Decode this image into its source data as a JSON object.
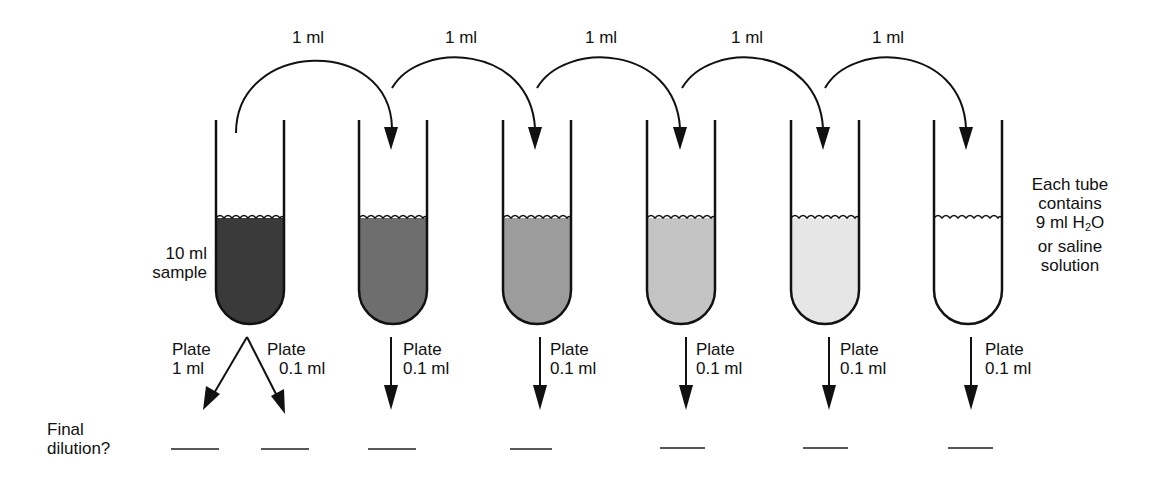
{
  "transfer_labels": [
    "1 ml",
    "1 ml",
    "1 ml",
    "1 ml",
    "1 ml"
  ],
  "sample_label": [
    "10 ml",
    "sample"
  ],
  "tube_note": [
    "Each tube",
    "contains",
    "9 ml H",
    "2",
    "O",
    "or saline",
    "solution"
  ],
  "tubes": [
    {
      "fill": "#3a3a3a"
    },
    {
      "fill": "#6e6e6e"
    },
    {
      "fill": "#9c9c9c"
    },
    {
      "fill": "#c4c4c4"
    },
    {
      "fill": "#e6e6e6"
    },
    {
      "fill": "#ffffff"
    }
  ],
  "plate_labels": [
    {
      "line1": "Plate",
      "line2": "1 ml"
    },
    {
      "line1": "Plate",
      "line2": "0.1 ml"
    },
    {
      "line1": "Plate",
      "line2": "0.1 ml"
    },
    {
      "line1": "Plate",
      "line2": "0.1 ml"
    },
    {
      "line1": "Plate",
      "line2": "0.1 ml"
    },
    {
      "line1": "Plate",
      "line2": "0.1 ml"
    },
    {
      "line1": "Plate",
      "line2": "0.1 ml"
    }
  ],
  "final_dilution_label": [
    "Final",
    "dilution?"
  ],
  "answer_blanks": 7
}
